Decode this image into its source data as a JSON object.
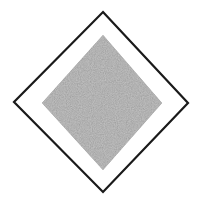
{
  "figure": {
    "canvas": {
      "width": 197,
      "height": 203,
      "background_color": "#ffffff"
    },
    "shapes": [
      {
        "name": "outer-diamond",
        "kind": "diamond-outline",
        "points": "103,12 188,103 103,192 14,102",
        "stroke_color": "#1a1a1a",
        "stroke_width": 2.2,
        "fill": "none"
      },
      {
        "name": "inner-diamond",
        "kind": "diamond-filled-noise",
        "points": "103,35 162,103 103,170 42,103",
        "fill_color": "#808080",
        "noise_contrast_light": "#a8a8a8",
        "noise_contrast_dark": "#5a5a5a",
        "stroke": "none"
      }
    ],
    "gap_color": "#ffffff",
    "texture": {
      "type": "fine-grain-noise",
      "base_gray": "#808080",
      "description": "speckled random monochrome grain"
    }
  }
}
